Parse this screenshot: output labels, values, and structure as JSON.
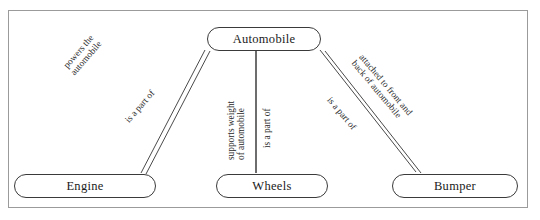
{
  "figure": {
    "frame": {
      "border_color": "#9b9b9b",
      "background": "#ffffff"
    },
    "line_color": "#4a4a4a",
    "text_color": "#1b1b1b"
  },
  "nodes": [
    {
      "id": "automobile",
      "label": "Automobile"
    },
    {
      "id": "engine",
      "label": "Engine"
    },
    {
      "id": "wheels",
      "label": "Wheels"
    },
    {
      "id": "bumper",
      "label": "Bumper"
    }
  ],
  "edges": [
    {
      "id": "engine-automobile",
      "from": "engine",
      "to": "automobile",
      "style": "double-line",
      "forward_label": "powers the\nautomobile",
      "forward_label_line1": "powers the",
      "forward_label_line2": "automobile",
      "reverse_label": "is a part of"
    },
    {
      "id": "wheels-automobile",
      "from": "wheels",
      "to": "automobile",
      "style": "single-line",
      "forward_label": "supports weight\nof automobile",
      "forward_label_line1": "supports weight",
      "forward_label_line2": "of automobile",
      "reverse_label": "is a part of"
    },
    {
      "id": "bumper-automobile",
      "from": "bumper",
      "to": "automobile",
      "style": "double-line",
      "forward_label": "attached to front and\nback of automobile",
      "forward_label_line1": "attached to front and",
      "forward_label_line2": "back of automobile",
      "reverse_label": "is a part of"
    }
  ]
}
